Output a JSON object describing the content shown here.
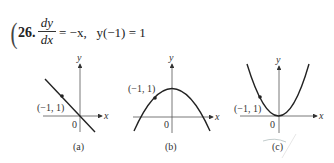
{
  "problem": {
    "number": "26.",
    "lhs_numerator": "dy",
    "lhs_denominator": "dx",
    "equation_rhs": "= −x,",
    "initial_condition": "y(−1) = 1"
  },
  "graphs": [
    {
      "id": "a",
      "caption": "(a)",
      "shape": "line",
      "point_label": "(−1, 1)",
      "origin_label": "0",
      "x_axis_label": "x",
      "y_axis_label": "y"
    },
    {
      "id": "b",
      "caption": "(b)",
      "shape": "downward parabola",
      "point_label": "(−1, 1)",
      "origin_label": "0",
      "x_axis_label": "x",
      "y_axis_label": "y"
    },
    {
      "id": "c",
      "caption": "(c)",
      "shape": "upward parabola",
      "point_label": "(−1, 1)",
      "origin_label": "0",
      "x_axis_label": "x",
      "y_axis_label": "y"
    }
  ],
  "colors": {
    "ink": "#333333",
    "background": "#ffffff"
  }
}
